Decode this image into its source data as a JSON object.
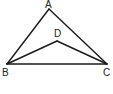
{
  "diagram": {
    "type": "geometry",
    "colors": {
      "stroke": "#1a1a1a",
      "label": "#222222",
      "background": "#ffffff"
    },
    "points": [
      {
        "id": "A",
        "label": "A",
        "x": 49,
        "y": 9,
        "lx": 45,
        "ly": 8
      },
      {
        "id": "B",
        "label": "B",
        "x": 7,
        "y": 64,
        "lx": 2,
        "ly": 76
      },
      {
        "id": "C",
        "label": "C",
        "x": 107,
        "y": 64,
        "lx": 103,
        "ly": 76
      },
      {
        "id": "D",
        "label": "D",
        "x": 57,
        "y": 41,
        "lx": 54,
        "ly": 37
      }
    ],
    "segments": [
      {
        "from": "A",
        "to": "B"
      },
      {
        "from": "A",
        "to": "C"
      },
      {
        "from": "B",
        "to": "C"
      },
      {
        "from": "B",
        "to": "D"
      },
      {
        "from": "D",
        "to": "C"
      }
    ]
  }
}
